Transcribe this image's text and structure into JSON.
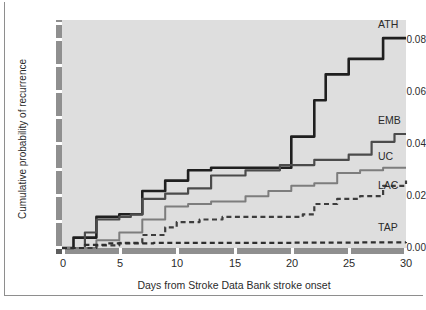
{
  "chart_data": {
    "type": "line",
    "title": "",
    "subtitle": "",
    "xlabel": "Days from Stroke Data Bank stroke onset",
    "ylabel": "Cumulative probability of recurrence",
    "xlim": [
      0,
      30
    ],
    "ylim": [
      0.0,
      0.088
    ],
    "xticks": [
      "0",
      "5",
      "10",
      "15",
      "20",
      "25",
      "30"
    ],
    "xtick_values": [
      0,
      5,
      10,
      15,
      20,
      25,
      30
    ],
    "yticks": [
      "0.00",
      "0.02",
      "0.04",
      "0.06",
      "0.08"
    ],
    "ytick_values": [
      0.0,
      0.02,
      0.04,
      0.06,
      0.08
    ],
    "grid": false,
    "legend_position": "right-inline-end-labels",
    "panel_background": "#dedede",
    "step_style": "kaplan-meier step function",
    "series": [
      {
        "name": "ATH",
        "label": "ATH",
        "color": "#1f1f1f",
        "linestyle": "solid",
        "linewidth": 2.6,
        "x": [
          0,
          1,
          3,
          5,
          6,
          7,
          9,
          11,
          13,
          18,
          20,
          22,
          23,
          25,
          28,
          30
        ],
        "values": [
          0.0,
          0.004,
          0.012,
          0.013,
          0.013,
          0.022,
          0.026,
          0.03,
          0.031,
          0.031,
          0.043,
          0.057,
          0.067,
          0.073,
          0.081,
          0.081
        ]
      },
      {
        "name": "EMB",
        "label": "EMB",
        "color": "#4b4b4b",
        "linestyle": "solid",
        "linewidth": 2.2,
        "x": [
          0,
          2,
          3,
          5,
          6,
          7,
          9,
          11,
          13,
          16,
          19,
          22,
          25,
          27,
          29,
          30
        ],
        "values": [
          0.0,
          0.006,
          0.011,
          0.012,
          0.013,
          0.019,
          0.021,
          0.023,
          0.028,
          0.03,
          0.032,
          0.034,
          0.036,
          0.041,
          0.044,
          0.044
        ]
      },
      {
        "name": "UC",
        "label": "UC",
        "color": "#7d7d7d",
        "linestyle": "solid",
        "linewidth": 2.0,
        "x": [
          0,
          3,
          5,
          7,
          9,
          11,
          13,
          16,
          18,
          20,
          22,
          24,
          26,
          28,
          30
        ],
        "values": [
          0.0,
          0.003,
          0.006,
          0.011,
          0.016,
          0.017,
          0.018,
          0.02,
          0.022,
          0.024,
          0.025,
          0.029,
          0.03,
          0.031,
          0.031
        ]
      },
      {
        "name": "LAC",
        "label": "LAC",
        "color": "#3d3d3d",
        "linestyle": "dashed",
        "linewidth": 2.2,
        "x": [
          0,
          3,
          5,
          7,
          9,
          10,
          12,
          14,
          17,
          19,
          21,
          22,
          24,
          26,
          28,
          30
        ],
        "values": [
          0.0,
          0.001,
          0.002,
          0.005,
          0.008,
          0.01,
          0.011,
          0.012,
          0.012,
          0.012,
          0.013,
          0.017,
          0.019,
          0.02,
          0.024,
          0.026
        ]
      },
      {
        "name": "TAP",
        "label": "TAP",
        "color": "#2e2e2e",
        "linestyle": "dashed",
        "linewidth": 2.2,
        "x": [
          0,
          2,
          4,
          8,
          14,
          20,
          26,
          30
        ],
        "values": [
          0.0,
          0.0012,
          0.0018,
          0.002,
          0.002,
          0.0021,
          0.0022,
          0.0023
        ]
      }
    ]
  }
}
